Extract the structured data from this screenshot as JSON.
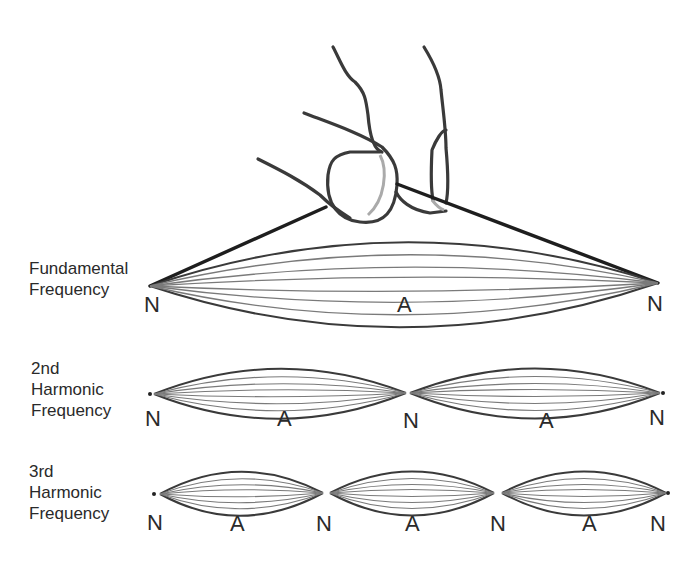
{
  "diagram": {
    "rows": [
      {
        "id": "fundamental",
        "label_lines": [
          "Fundamental",
          "Frequency"
        ],
        "markers": [
          "N",
          "A",
          "N"
        ]
      },
      {
        "id": "second",
        "label_lines": [
          "2nd",
          "Harmonic",
          "Frequency"
        ],
        "markers": [
          "N",
          "A",
          "N",
          "A",
          "N"
        ]
      },
      {
        "id": "third",
        "label_lines": [
          "3rd",
          "Harmonic",
          "Frequency"
        ],
        "markers": [
          "N",
          "A",
          "N",
          "A",
          "N",
          "A",
          "N"
        ]
      }
    ],
    "legend": {
      "node": "N",
      "antinode": "A"
    },
    "colors": {
      "string": "#222222",
      "envelope": "#444444",
      "inner": "#777777",
      "shadow": "#aaaaaa"
    }
  }
}
